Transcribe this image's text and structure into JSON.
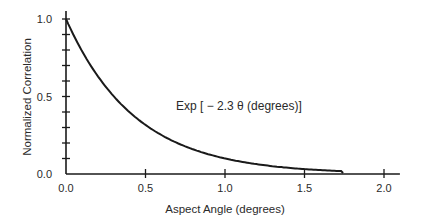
{
  "chart_data": {
    "type": "line",
    "title": "",
    "xlabel": "Aspect Angle (degrees)",
    "ylabel": "Normalized Correlation",
    "xlim": [
      0.0,
      2.1
    ],
    "ylim": [
      0.0,
      1.0
    ],
    "x_ticks": [
      "0.0",
      "0.5",
      "1.0",
      "1.5",
      "2.0"
    ],
    "y_ticks": [
      "0.0",
      "0.5",
      "1.0"
    ],
    "y_minor_tick_step": 0.1,
    "grid": false,
    "annotation": "Exp [ − 2.3 θ (degrees)]",
    "series": [
      {
        "name": "Exp[-2.3 θ]",
        "x": [
          0.0,
          0.1,
          0.2,
          0.3,
          0.4,
          0.5,
          0.6,
          0.7,
          0.8,
          0.9,
          1.0,
          1.1,
          1.2,
          1.3,
          1.4,
          1.5,
          1.6,
          1.73
        ],
        "values": [
          1.0,
          0.79,
          0.63,
          0.5,
          0.4,
          0.32,
          0.25,
          0.2,
          0.16,
          0.13,
          0.1,
          0.08,
          0.065,
          0.05,
          0.04,
          0.032,
          0.025,
          0.019
        ]
      }
    ]
  }
}
